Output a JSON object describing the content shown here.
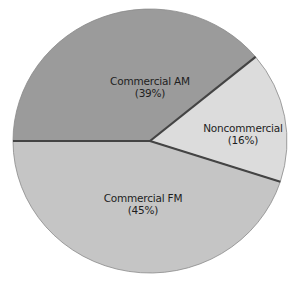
{
  "chart_data": {
    "type": "pie",
    "title": "",
    "categories": [
      "Commercial AM",
      "Noncommercial",
      "Commercial FM"
    ],
    "values": [
      39,
      16,
      45
    ],
    "unit": "%",
    "slices": [
      {
        "label": "Commercial AM",
        "value": 39,
        "value_label": "(39%)",
        "color": "#9b9b9b"
      },
      {
        "label": "Noncommercial",
        "value": 16,
        "value_label": "(16%)",
        "color": "#dcdcdc"
      },
      {
        "label": "Commercial FM",
        "value": 45,
        "value_label": "(45%)",
        "color": "#c5c5c5"
      }
    ],
    "start_angle_deg": 180,
    "direction": "clockwise",
    "divider_color": "#444444",
    "legend": "none (labels inside slices)"
  }
}
